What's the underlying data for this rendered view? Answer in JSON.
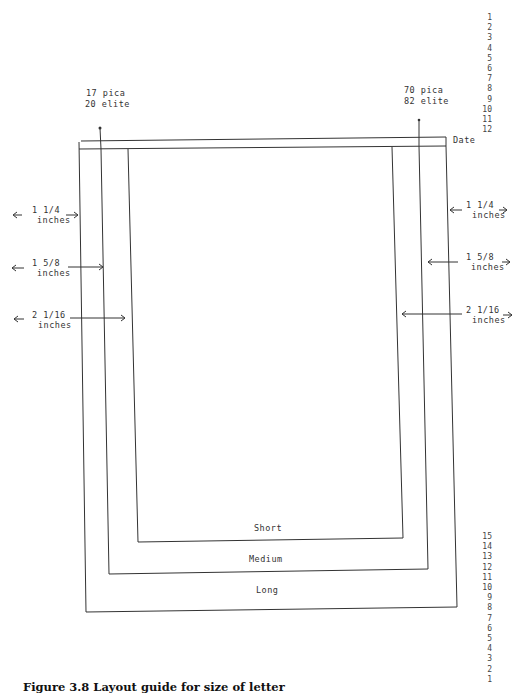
{
  "figure": {
    "caption": "Figure 3.8  Layout guide for size of letter",
    "left_marker": {
      "line1": "17 pica",
      "line2": "20 elite"
    },
    "right_marker": {
      "line1": "70 pica",
      "line2": "82 elite"
    },
    "date_label": "Date",
    "top_line_numbers": [
      "1",
      "2",
      "3",
      "4",
      "5",
      "6",
      "7",
      "8",
      "9",
      "10",
      "11",
      "12"
    ],
    "bottom_line_numbers": [
      "15",
      "14",
      "13",
      "12",
      "11",
      "10",
      "9",
      "8",
      "7",
      "6",
      "5",
      "4",
      "3",
      "2",
      "1"
    ],
    "margins_left": [
      {
        "value": "1 1/4",
        "unit": "inches",
        "target": "long"
      },
      {
        "value": "1 5/8",
        "unit": "inches",
        "target": "medium"
      },
      {
        "value": "2 1/16",
        "unit": "inches",
        "target": "short"
      }
    ],
    "margins_right": [
      {
        "value": "1 1/4",
        "unit": "inches",
        "target": "long"
      },
      {
        "value": "1 5/8",
        "unit": "inches",
        "target": "medium"
      },
      {
        "value": "2 1/16",
        "unit": "inches",
        "target": "short"
      }
    ],
    "boxes": [
      {
        "label": "Short"
      },
      {
        "label": "Medium"
      },
      {
        "label": "Long"
      }
    ],
    "colors": {
      "line": "#333333",
      "background": "#ffffff"
    }
  }
}
